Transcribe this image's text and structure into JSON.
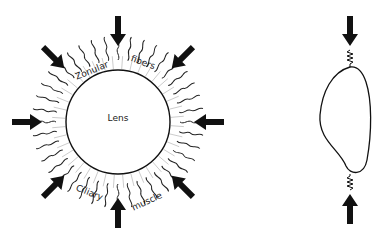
{
  "diagram": {
    "left": {
      "lens_label": "Lens",
      "zonular_word1": "Zonular",
      "zonular_word2": "fibers",
      "ciliary_word1": "Ciliary",
      "ciliary_word2": "muscle"
    },
    "right": {
      "description": "Side view of lens compressed by arrows via springs"
    },
    "colors": {
      "ink": "#111111",
      "background": "#ffffff"
    }
  }
}
